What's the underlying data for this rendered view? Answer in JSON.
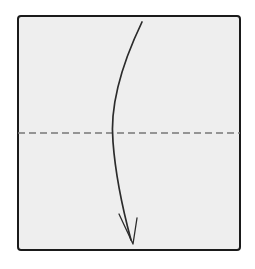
{
  "diagram": {
    "type": "origami-instruction",
    "canvas": {
      "width": 255,
      "height": 269,
      "background": "#ffffff"
    },
    "paper": {
      "name": "square-sheet",
      "shape": "square",
      "fill": "#eeeeee",
      "stroke": "#1a1a1a",
      "stroke_width": 2.0,
      "corner_radius": 3,
      "x": 18,
      "y": 16,
      "width": 222,
      "height": 234
    },
    "crease": {
      "name": "horizontal-crease",
      "fold_type": "valley",
      "line_style": "dashed",
      "stroke": "#777777",
      "stroke_width": 1.6,
      "dash_pattern": "7 4",
      "x1": 18,
      "y1": 133,
      "x2": 240,
      "y2": 133,
      "orientation": "horizontal",
      "position_label": "midpoint"
    },
    "arrow": {
      "name": "fold-direction-arrow",
      "direction": "top-to-bottom",
      "stroke": "#2b2b2b",
      "stroke_width": 1.7,
      "path": "M 142 22 C 118 72, 110 110, 113 142 C 116 182, 124 214, 131 240",
      "head": {
        "style": "open-barb",
        "tip_x": 133,
        "tip_y": 244,
        "path": "M 119 214 L 133 244 L 137 218 L 133 244 Z"
      },
      "start_x": 142,
      "start_y": 22,
      "end_x": 133,
      "end_y": 244
    }
  }
}
